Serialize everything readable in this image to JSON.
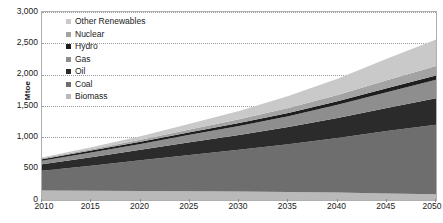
{
  "chart_data": {
    "type": "area",
    "stacked": true,
    "title": "",
    "xlabel": "",
    "ylabel": "Mtoe",
    "x": [
      2010,
      2015,
      2020,
      2025,
      2030,
      2035,
      2040,
      2045,
      2050
    ],
    "xlim": [
      2010,
      2050
    ],
    "ylim": [
      0,
      3000
    ],
    "ytick_labels": [
      "0",
      "500",
      "1,000",
      "1,500",
      "2,000",
      "2,500",
      "3,000"
    ],
    "ytick_values": [
      0,
      500,
      1000,
      1500,
      2000,
      2500,
      3000
    ],
    "xtick_labels": [
      "2010",
      "2015",
      "2020",
      "2025",
      "2030",
      "2035",
      "2040",
      "2045",
      "2050"
    ],
    "grid": true,
    "grid_style": "dotted horizontal",
    "legend_position": "inside top-left",
    "series": [
      {
        "name": "Biomass",
        "color": "#b9b9b9",
        "values": [
          150,
          148,
          145,
          140,
          136,
          128,
          118,
          105,
          92
        ]
      },
      {
        "name": "Coal",
        "color": "#6e6e6e",
        "values": [
          315,
          400,
          490,
          580,
          665,
          760,
          870,
          995,
          1110
        ]
      },
      {
        "name": "Oil",
        "color": "#2b2b2b",
        "values": [
          105,
          135,
          165,
          200,
          235,
          275,
          320,
          370,
          420
        ]
      },
      {
        "name": "Gas",
        "color": "#8e8e8e",
        "values": [
          55,
          75,
          95,
          120,
          145,
          175,
          210,
          250,
          295
        ]
      },
      {
        "name": "Hydro",
        "color": "#1e1e1e",
        "values": [
          25,
          30,
          35,
          40,
          46,
          52,
          58,
          64,
          70
        ]
      },
      {
        "name": "Nuclear",
        "color": "#a3a3a3",
        "values": [
          15,
          22,
          32,
          45,
          60,
          78,
          100,
          125,
          150
        ]
      },
      {
        "name": "Other Renewables",
        "color": "#c9c9c9",
        "values": [
          15,
          30,
          55,
          90,
          135,
          190,
          260,
          345,
          425
        ]
      }
    ],
    "totals": [
      680,
      840,
      1017,
      1215,
      1422,
      1658,
      1936,
      2254,
      2562
    ],
    "legend_order_top_to_bottom": [
      "Other Renewables",
      "Nuclear",
      "Hydro",
      "Gas",
      "Oil",
      "Coal",
      "Biomass"
    ]
  },
  "axes": {
    "y_title": "Mtoe"
  },
  "colors": {
    "plot_border": "#b0b0b0",
    "gridline": "#9a9a9a",
    "text": "#1a1a1a",
    "background": "#ffffff"
  }
}
